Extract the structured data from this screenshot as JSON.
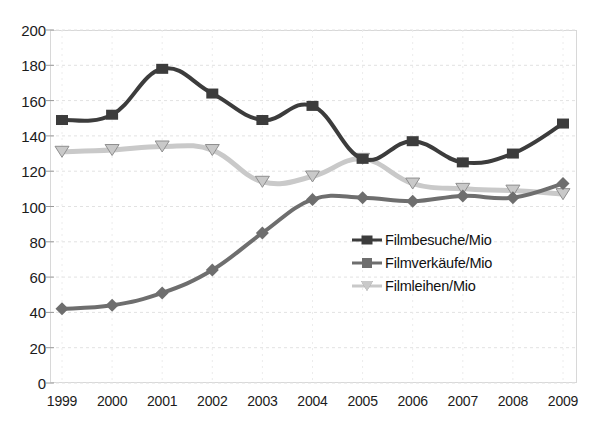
{
  "chart_data": {
    "type": "line",
    "title": "",
    "subtitle": "",
    "xlabel": "",
    "ylabel": "",
    "categories": [
      "1999",
      "2000",
      "2001",
      "2002",
      "2003",
      "2004",
      "2005",
      "2006",
      "2007",
      "2008",
      "2009"
    ],
    "ylim": [
      0,
      200
    ],
    "yticks": [
      0,
      20,
      40,
      60,
      80,
      100,
      120,
      140,
      160,
      180,
      200
    ],
    "ytick_labels": [
      "0",
      "20",
      "40",
      "60",
      "80",
      "100",
      "120",
      "140",
      "160",
      "180",
      "200"
    ],
    "grid": true,
    "legend_position": "center-right-inside",
    "series": [
      {
        "name": "Filmbesuche/Mio",
        "marker": "square",
        "color": "#3c3c3c",
        "values": [
          149,
          152,
          178,
          164,
          149,
          157,
          127,
          137,
          125,
          130,
          147
        ]
      },
      {
        "name": "Filmverkäufe/Mio",
        "marker": "diamond",
        "color": "#6e6e6e",
        "values": [
          42,
          44,
          51,
          64,
          85,
          104,
          105,
          103,
          106,
          105,
          113
        ]
      },
      {
        "name": "Filmleihen/Mio",
        "marker": "triangle-down",
        "color": "#c9c9c9",
        "values": [
          131,
          132,
          134,
          132,
          114,
          117,
          127,
          113,
          110,
          109,
          107
        ]
      }
    ]
  },
  "axes": {
    "y_axis_name": "value-axis",
    "x_axis_name": "year-axis"
  },
  "colors": {
    "grid": "#e2e2e2",
    "frame": "#d8d8d8",
    "text": "#1b1b1b",
    "background": "#ffffff"
  }
}
